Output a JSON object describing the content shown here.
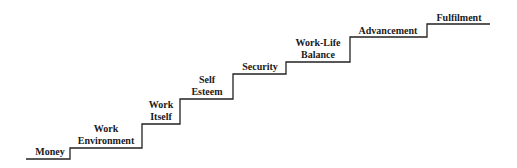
{
  "diagram": {
    "type": "staircase",
    "line_color": "#222222",
    "steps": [
      {
        "label_lines": [
          "Money"
        ]
      },
      {
        "label_lines": [
          "Work",
          "Environment"
        ]
      },
      {
        "label_lines": [
          "Work",
          "Itself"
        ]
      },
      {
        "label_lines": [
          "Self",
          "Esteem"
        ]
      },
      {
        "label_lines": [
          "Security"
        ]
      },
      {
        "label_lines": [
          "Work-Life",
          "Balance"
        ]
      },
      {
        "label_lines": [
          "Advancement"
        ]
      },
      {
        "label_lines": [
          "Fulfilment"
        ]
      }
    ]
  }
}
